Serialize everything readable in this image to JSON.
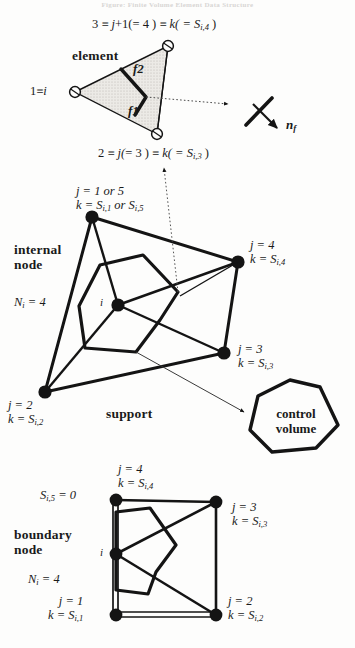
{
  "header": {
    "caption": "Figure: Finite Volume Element Data Structure"
  },
  "element": {
    "title": "element",
    "top_vertex_label": {
      "a": "3",
      "eq1": "≡",
      "b": "j",
      "plus": "+",
      "c": "1(",
      "d": "= 4 )",
      "eq2": "≡",
      "e": "k( = ",
      "f": "S",
      "fsub": "i,4",
      "close": " )"
    },
    "bottom_vertex_label": {
      "a": "2",
      "eq1": "≡",
      "b": "j(",
      "d": "= 3 )",
      "eq2": "≡",
      "e": "k( = ",
      "f": "S",
      "fsub": "i,3",
      "close": " )"
    },
    "left_vertex_label": {
      "a": "1",
      "eq": "≡",
      "b": "i"
    },
    "face_1": "f1",
    "face_2": "f2",
    "normal_label": "n",
    "normal_sub": "f"
  },
  "internal": {
    "title_line1": "internal",
    "title_line2": "node",
    "count_label": "N",
    "count_sub": "i",
    "count_value": "= 4",
    "support_label": "support",
    "nodes": [
      {
        "name": "node-j1-or-5",
        "line1": "j = 1 or 5",
        "line2_a": "k = ",
        "line2_s1": "S",
        "line2_sub1": "i,1",
        "line2_mid": " or ",
        "line2_s2": "S",
        "line2_sub2": "i,5"
      },
      {
        "name": "node-j4",
        "line1": "j = 4",
        "line2_a": "k = ",
        "line2_s1": "S",
        "line2_sub1": "i,4"
      },
      {
        "name": "node-j3",
        "line1": "j = 3",
        "line2_a": "k = ",
        "line2_s1": "S",
        "line2_sub1": "i,3"
      },
      {
        "name": "node-j2",
        "line1": "j = 2",
        "line2_a": "k = ",
        "line2_s1": "S",
        "line2_sub1": "i,2"
      }
    ],
    "center_node": "i"
  },
  "control_volume": {
    "line1": "control",
    "line2": "volume"
  },
  "boundary": {
    "title_line1": "boundary",
    "title_line2": "node",
    "count_label": "N",
    "count_sub": "i",
    "count_value": "= 4",
    "zero_label_s": "S",
    "zero_label_sub": "i,5",
    "zero_label_eq": " = 0",
    "center_node": "i",
    "nodes": [
      {
        "name": "node-j4",
        "line1": "j = 4",
        "line2_a": "k = ",
        "line2_s1": "S",
        "line2_sub1": "i,4"
      },
      {
        "name": "node-j3",
        "line1": "j = 3",
        "line2_a": "k = ",
        "line2_s1": "S",
        "line2_sub1": "i,3"
      },
      {
        "name": "node-j1",
        "line1": "j = 1",
        "line2_a": "k = ",
        "line2_s1": "S",
        "line2_sub1": "i,1"
      },
      {
        "name": "node-j2",
        "line1": "j = 2",
        "line2_a": "k = ",
        "line2_s1": "S",
        "line2_sub1": "i,2"
      }
    ]
  },
  "colors": {
    "ink": "#141414",
    "fill": "#e2e0dc",
    "paper": "#fdfdfc"
  }
}
